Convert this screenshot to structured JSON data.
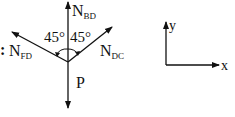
{
  "diagram": {
    "prefix": ":",
    "forces": {
      "up": {
        "main": "N",
        "sub": "BD"
      },
      "left": {
        "main": "N",
        "sub": "FD"
      },
      "right": {
        "main": "N",
        "sub": "DC"
      },
      "down": {
        "main": "P",
        "sub": ""
      }
    },
    "angles": {
      "left": "45°",
      "right": "45°"
    },
    "axes": {
      "x": "x",
      "y": "y"
    },
    "colors": {
      "ink": "#111111",
      "background": "#ffffff"
    }
  }
}
